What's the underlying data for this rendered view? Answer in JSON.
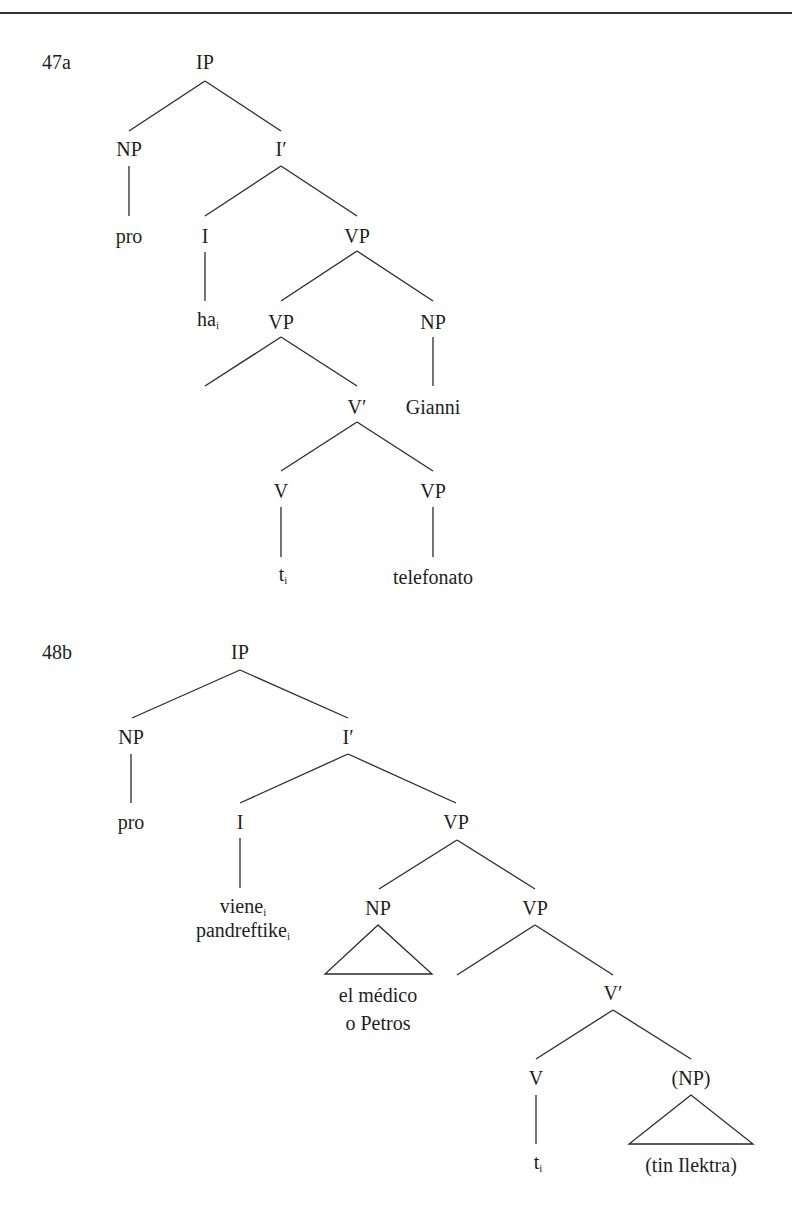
{
  "header": {
    "rule": true
  },
  "trees": [
    {
      "example_number": "47a",
      "nodes": {
        "ip": "IP",
        "np_subj": "NP",
        "ibar": "I′",
        "pro": "pro",
        "i": "I",
        "vp1": "VP",
        "ha": "ha",
        "ha_index": "i",
        "vp2": "VP",
        "np_obj": "NP",
        "vbar": "V′",
        "gianni": "Gianni",
        "v": "V",
        "vp3": "VP",
        "t": "t",
        "t_index": "i",
        "telefonato": "telefonato"
      }
    },
    {
      "example_number": "48b",
      "nodes": {
        "ip": "IP",
        "np_subj": "NP",
        "ibar": "I′",
        "pro": "pro",
        "i": "I",
        "vp1": "VP",
        "viene": "viene",
        "viene_index": "i",
        "pandreftike": "pandreftike",
        "pandreftike_index": "i",
        "np_spec": "NP",
        "vp2": "VP",
        "el_medico": "el médico",
        "o_petros": "o Petros",
        "vbar": "V′",
        "v": "V",
        "np_opt": "(NP)",
        "t": "t",
        "t_index": "i",
        "tin_ilektra": "(tin Ilektra)"
      }
    }
  ]
}
